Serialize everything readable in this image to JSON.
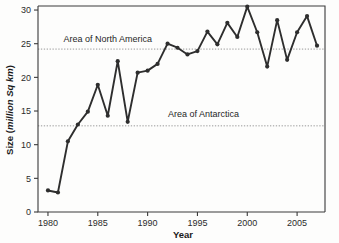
{
  "chart_data": {
    "type": "line",
    "title": "",
    "xlabel": "Year",
    "ylabel": "Size (million Sq km)",
    "ylabel_plain": "Size (",
    "ylabel_italic": "million Sq km",
    "ylabel_close": ")",
    "xlim": [
      1979.0,
      2007.8
    ],
    "ylim": [
      0,
      30.6
    ],
    "grid": false,
    "legend": "none",
    "x": [
      1980,
      1981,
      1982,
      1983,
      1984,
      1985,
      1986,
      1987,
      1988,
      1989,
      1990,
      1991,
      1992,
      1993,
      1994,
      1995,
      1996,
      1997,
      1998,
      1999,
      2000,
      2001,
      2002,
      2003,
      2004,
      2005,
      2006,
      2007
    ],
    "values": [
      3.2,
      2.9,
      10.5,
      13.0,
      14.9,
      18.9,
      14.3,
      22.4,
      13.4,
      20.7,
      21.0,
      22.0,
      25.0,
      24.4,
      23.4,
      23.9,
      26.8,
      24.9,
      28.1,
      26.0,
      30.5,
      26.7,
      21.6,
      28.5,
      22.6,
      26.7,
      29.1,
      24.7
    ],
    "series": [
      {
        "name": "Ozone hole size",
        "values": [
          3.2,
          2.9,
          10.5,
          13.0,
          14.9,
          18.9,
          14.3,
          22.4,
          13.4,
          20.7,
          21.0,
          22.0,
          25.0,
          24.4,
          23.4,
          23.9,
          26.8,
          24.9,
          28.1,
          26.0,
          30.5,
          26.7,
          21.6,
          28.5,
          22.6,
          26.7,
          29.1,
          24.7
        ]
      }
    ],
    "xticks": [
      1980,
      1985,
      1990,
      1995,
      2000,
      2005
    ],
    "xtick_labels": [
      "1980",
      "1985",
      "1990",
      "1995",
      "2000",
      "2005"
    ],
    "yticks": [
      0,
      5,
      10,
      15,
      20,
      25,
      30
    ],
    "ytick_labels": [
      "0",
      "5",
      "10",
      "15",
      "20",
      "25",
      "30"
    ],
    "reference_lines": [
      {
        "label": "Area of North America",
        "value": 24.2,
        "label_x": 1986.0,
        "label_y_offset": 1.1
      },
      {
        "label": "Area of Antarctica",
        "value": 12.8,
        "label_x": 1995.6,
        "label_y_offset": 1.3
      }
    ],
    "colors": {
      "line": "#2e2e2e",
      "marker": "#2e2e2e",
      "axis": "#3a3a3a",
      "reference_line": "#8d8d8d",
      "background": "#fdfdfc",
      "text": "#1f1f1f"
    }
  }
}
